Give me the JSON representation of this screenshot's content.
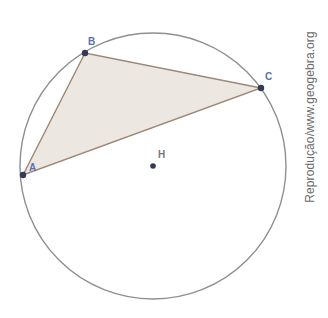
{
  "diagram": {
    "type": "geometry",
    "circle": {
      "center": [
        153,
        166
      ],
      "radius": 133,
      "stroke": "#8f8f8f"
    },
    "triangle": {
      "fill": "#ede7e1",
      "stroke": "#9c8675",
      "vertices": [
        {
          "name": "A",
          "label": "A",
          "x": 23,
          "y": 175,
          "label_x": 29,
          "label_y": 171
        },
        {
          "name": "B",
          "label": "B",
          "x": 85,
          "y": 53,
          "label_x": 88,
          "label_y": 45
        },
        {
          "name": "C",
          "label": "C",
          "x": 261,
          "y": 88,
          "label_x": 265,
          "label_y": 80
        }
      ]
    },
    "center_point": {
      "name": "H",
      "label": "H",
      "x": 153,
      "y": 166,
      "label_x": 158,
      "label_y": 158
    },
    "point_color": "#333a55",
    "label_color": "#5a6fb0"
  },
  "credit": {
    "text": "Reprodução/www.geogebra.org"
  }
}
